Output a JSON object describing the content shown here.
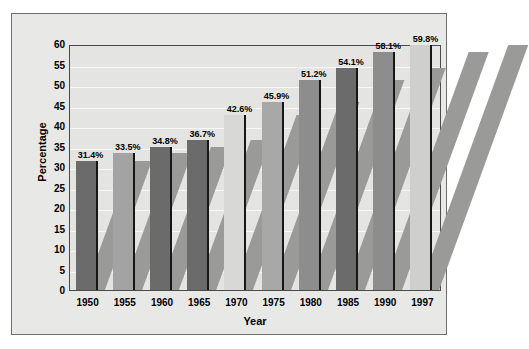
{
  "chart_data": {
    "type": "bar",
    "title": "",
    "xlabel": "Year",
    "ylabel": "Percentage",
    "categories": [
      "1950",
      "1955",
      "1960",
      "1965",
      "1970",
      "1975",
      "1980",
      "1985",
      "1990",
      "1997"
    ],
    "values": [
      31.4,
      33.5,
      34.8,
      36.7,
      42.6,
      45.9,
      51.2,
      54.1,
      58.1,
      59.8
    ],
    "data_labels": [
      "31.4%",
      "33.5%",
      "34.8%",
      "36.7%",
      "42.6%",
      "45.9%",
      "51.2%",
      "54.1%",
      "58.1%",
      "59.8%"
    ],
    "bar_colors": [
      "#6b6b6b",
      "#a3a3a3",
      "#6b6b6b",
      "#6b6b6b",
      "#d8d8d6",
      "#a8a8a8",
      "#8d8d8d",
      "#6b6b6b",
      "#8d8d8d",
      "#cfcfcd"
    ],
    "ylim": [
      0,
      60
    ],
    "ytick_labels": [
      "60",
      "55",
      "50",
      "45",
      "40",
      "35",
      "30",
      "25",
      "20",
      "15",
      "10",
      "5",
      "0"
    ],
    "ytick_values": [
      60,
      55,
      50,
      45,
      40,
      35,
      30,
      25,
      20,
      15,
      10,
      5,
      0
    ],
    "grid": true,
    "legend": "none",
    "plot_background": "#e4e4e2",
    "figure_background": "#e8e8e6",
    "axis_color": "#4a4a4a",
    "gridline_color": "#f7f7f5"
  }
}
